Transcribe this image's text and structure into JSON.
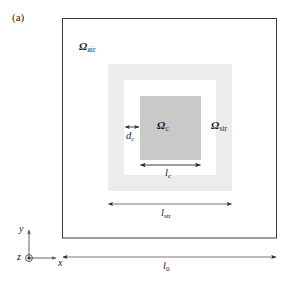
{
  "figure": {
    "panel_label": "(a)",
    "domains": {
      "air": {
        "symbol": "Ω",
        "subscript": "air",
        "name": "omega-air",
        "fill": "#ffffff"
      },
      "structure": {
        "symbol": "Ω",
        "subscript": "str",
        "name": "omega-str",
        "fill": "#ececec"
      },
      "core": {
        "symbol": "Ω",
        "subscript": "c",
        "name": "omega-c",
        "fill": "#c9c9c9"
      }
    },
    "dimensions": [
      {
        "id": "d_c",
        "symbol": "d",
        "subscript": "c",
        "label": "dc-dimension"
      },
      {
        "id": "l_c",
        "symbol": "l",
        "subscript": "c",
        "label": "lc-dimension"
      },
      {
        "id": "l_str",
        "symbol": "l",
        "subscript": "str",
        "label": "lstr-dimension"
      },
      {
        "id": "l_0",
        "symbol": "l",
        "subscript": "0",
        "label": "l0-dimension"
      }
    ],
    "axes": {
      "x": "x",
      "y": "y",
      "z": "z"
    },
    "colors": {
      "outline": "#3a3a3a",
      "structure_fill": "#ececec",
      "core_fill": "#c9c9c9",
      "arrow": "#2b2b2b",
      "text": "#1a1a1a"
    }
  }
}
